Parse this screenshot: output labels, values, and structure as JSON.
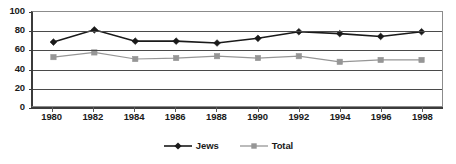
{
  "chart_data": {
    "type": "line",
    "title": "",
    "xlabel": "",
    "ylabel": "",
    "categories": [
      "1980",
      "1982",
      "1984",
      "1986",
      "1988",
      "1990",
      "1992",
      "1994",
      "1996",
      "1998"
    ],
    "x": [
      1980,
      1982,
      1984,
      1986,
      1988,
      1990,
      1992,
      1994,
      1996,
      1998
    ],
    "series": [
      {
        "name": "Jews",
        "marker": "diamond",
        "color": "#1a1a1a",
        "values": [
          68,
          81,
          69,
          69,
          67,
          72,
          79,
          77,
          74,
          79
        ]
      },
      {
        "name": "Total",
        "marker": "square",
        "color": "#969696",
        "values": [
          52,
          57,
          50,
          51,
          53,
          51,
          53,
          47,
          49,
          49
        ]
      }
    ],
    "ylim": [
      0,
      100
    ],
    "ytick_labels": [
      "100",
      "80",
      "60",
      "40",
      "20",
      "0"
    ],
    "yticks": [
      100,
      80,
      60,
      40,
      20,
      0
    ],
    "grid": true,
    "grid_axis": "y",
    "legend_position": "bottom-center"
  }
}
